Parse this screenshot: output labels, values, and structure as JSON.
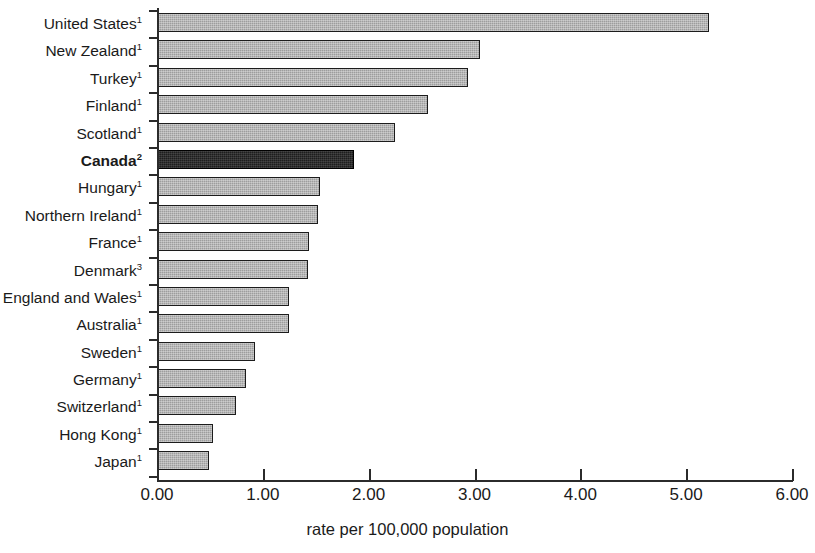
{
  "chart_data": {
    "type": "bar",
    "orientation": "horizontal",
    "title": "",
    "xlabel": "rate per 100,000 population",
    "ylabel": "",
    "xlim": [
      0,
      6
    ],
    "xticks": [
      "0.00",
      "1.00",
      "2.00",
      "3.00",
      "4.00",
      "5.00",
      "6.00"
    ],
    "xtick_values": [
      0,
      1,
      2,
      3,
      4,
      5,
      6
    ],
    "grid": false,
    "legend": null,
    "categories": [
      "United States",
      "New Zealand",
      "Turkey",
      "Finland",
      "Scotland",
      "Canada",
      "Hungary",
      "Northern Ireland",
      "France",
      "Denmark",
      "England and Wales",
      "Australia",
      "Sweden",
      "Germany",
      "Switzerland",
      "Hong Kong",
      "Japan"
    ],
    "footnote_markers": [
      "1",
      "1",
      "1",
      "1",
      "1",
      "2",
      "1",
      "1",
      "1",
      "3",
      "1",
      "1",
      "1",
      "1",
      "1",
      "1",
      "1"
    ],
    "values": [
      5.21,
      3.04,
      2.93,
      2.55,
      2.24,
      1.85,
      1.53,
      1.51,
      1.43,
      1.42,
      1.24,
      1.24,
      0.92,
      0.83,
      0.74,
      0.52,
      0.48
    ],
    "highlight_category": "Canada",
    "colors": {
      "bar_fill": "#9d9d9d",
      "bar_border": "#1c1c1c",
      "highlight_fill": "#1d1d1d",
      "axis": "#2b2b2b",
      "text": "#1a1a1a"
    }
  }
}
